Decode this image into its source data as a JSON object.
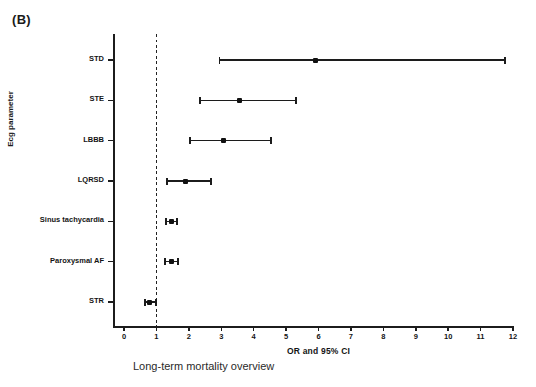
{
  "panel": {
    "label": "(B)"
  },
  "caption": {
    "text": "Long-term mortality overview"
  },
  "chart_data": {
    "type": "scatter",
    "subtype": "forest-plot",
    "title": "(B)",
    "caption": "Long-term mortality overview",
    "xlabel": "OR and 95% CI",
    "ylabel": "Ecg parameter",
    "xlim": [
      0,
      12
    ],
    "xticks": [
      0,
      1,
      2,
      3,
      4,
      5,
      6,
      7,
      8,
      9,
      10,
      11,
      12
    ],
    "xtick_labels": [
      "0",
      "1",
      "2",
      "3",
      "4",
      "5",
      "6",
      "7",
      "8",
      "9",
      "10",
      "11",
      "12"
    ],
    "grid": false,
    "legend": "none",
    "reference_line": 1,
    "reference_line_style": "dashed",
    "categories": [
      "STD",
      "STE",
      "LBBB",
      "LQRSD",
      "Sinus tachycardia",
      "Paroxysmal AF",
      "STR"
    ],
    "points": [
      {
        "label": "STD",
        "or": 5.92,
        "ci_low": 2.94,
        "ci_high": 11.75
      },
      {
        "label": "STE",
        "or": 3.55,
        "ci_low": 2.35,
        "ci_high": 5.31
      },
      {
        "label": "LBBB",
        "or": 3.06,
        "ci_low": 2.04,
        "ci_high": 4.54
      },
      {
        "label": "LQRSD",
        "or": 1.91,
        "ci_low": 1.33,
        "ci_high": 2.69
      },
      {
        "label": "Sinus tachycardia",
        "or": 1.45,
        "ci_low": 1.3,
        "ci_high": 1.64
      },
      {
        "label": "Paroxysmal AF",
        "or": 1.45,
        "ci_low": 1.27,
        "ci_high": 1.67
      },
      {
        "label": "STR",
        "or": 0.8,
        "ci_low": 0.65,
        "ci_high": 0.99
      }
    ],
    "colors": {
      "marker": "#111111",
      "line": "#1c1c1c",
      "axis": "#1c1c1c",
      "background": "#ffffff"
    }
  }
}
